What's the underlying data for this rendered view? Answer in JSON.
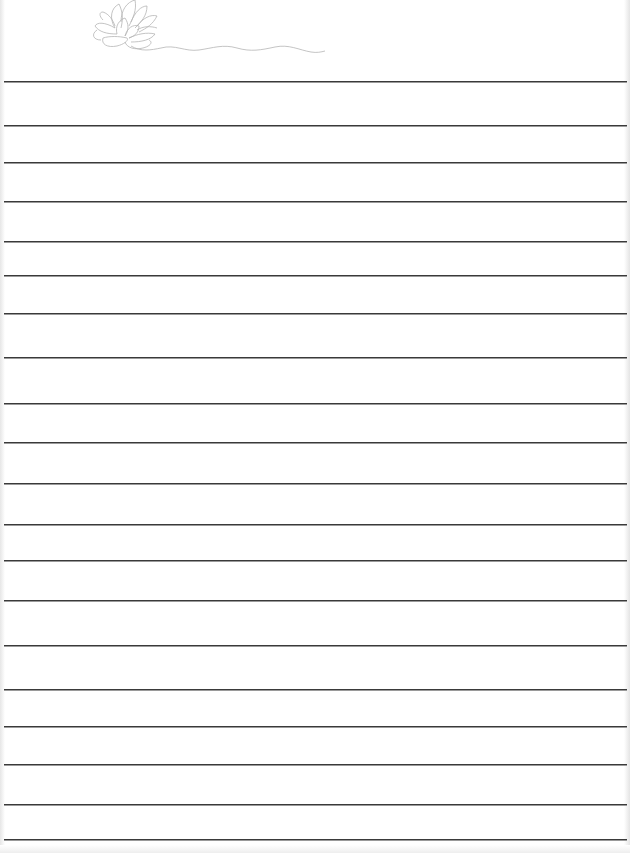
{
  "paper": {
    "type": "lined notepaper",
    "decoration": "lotus-flower-icon",
    "line_color": "#3a3a3a",
    "decoration_color": "#b5b5b5",
    "line_count": 20,
    "line_positions": [
      81,
      125,
      162,
      201,
      241,
      275,
      313,
      357,
      403,
      442,
      483,
      524,
      560,
      600,
      645,
      689,
      726,
      764,
      804,
      839
    ]
  }
}
